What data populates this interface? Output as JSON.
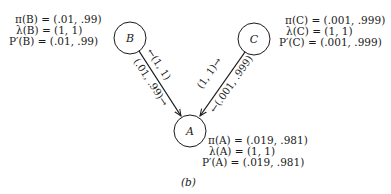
{
  "diagram": {
    "type": "bayesian-network",
    "caption": "(b)",
    "nodes": {
      "B": {
        "label": "B",
        "lines": [
          "π(B) = (.01, .99)",
          "λ(B) = (1, 1)",
          "P′(B) = (.01, .99)"
        ]
      },
      "C": {
        "label": "C",
        "lines": [
          "π(C) = (.001, .999)",
          "λ(C) = (1, 1)",
          "P′(C) = (.001, .999)"
        ]
      },
      "A": {
        "label": "A",
        "lines": [
          "π(A) = (.019, .981)",
          "λ(A) = (1, 1)",
          "P′(A) = (.019, .981)"
        ]
      }
    },
    "edges": {
      "BA": {
        "from": "B",
        "to": "A",
        "lambda_msg": "←(1, 1)",
        "pi_msg": "(.01, .99)→"
      },
      "CA": {
        "from": "C",
        "to": "A",
        "lambda_msg": "(1, 1)→",
        "pi_msg": "←(.001, .999)"
      }
    }
  }
}
